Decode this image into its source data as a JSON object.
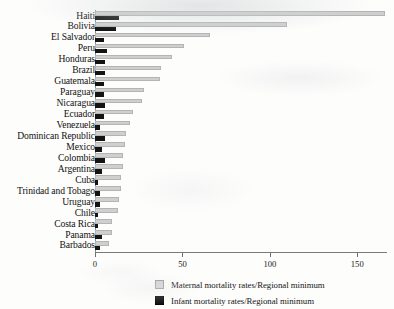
{
  "chart_data": {
    "type": "bar",
    "orientation": "horizontal",
    "title": "",
    "subtitle": "",
    "xlabel": "",
    "ylabel": "",
    "xlim": [
      0,
      170
    ],
    "xticks": [
      0,
      50,
      100,
      150
    ],
    "xticklabels": [
      "0",
      "50",
      "100",
      "150"
    ],
    "grid": false,
    "legend_position": "bottom",
    "categories": [
      "Haiti",
      "Bolivia",
      "El Salvador",
      "Peru",
      "Honduras",
      "Brazil",
      "Guatemala",
      "Paraguay",
      "Nicaragua",
      "Ecuador",
      "Venezuela",
      "Dominican Republic",
      "Mexico",
      "Colombia",
      "Argentina",
      "Cuba",
      "Trinidad and Tobago",
      "Uruguay",
      "Chile",
      "Costa Rica",
      "Panama",
      "Barbados"
    ],
    "series": [
      {
        "name": "Maternal mortality rates/Regional minimum",
        "color": "#cfcfcf",
        "values": [
          166,
          110,
          66,
          51,
          44,
          38,
          37,
          28,
          27,
          22,
          20,
          18,
          17,
          16,
          16,
          15,
          15,
          14,
          13,
          10,
          10,
          8
        ]
      },
      {
        "name": "Infant mortality rates/Regional minimum",
        "color": "#141414",
        "values": [
          14,
          12,
          5,
          7,
          6,
          6,
          5,
          5,
          6,
          5,
          3,
          6,
          4,
          6,
          4,
          2,
          3,
          3,
          2,
          2,
          4,
          3
        ]
      }
    ]
  },
  "legend": {
    "items": [
      {
        "label": "Maternal mortality rates/Regional minimum",
        "swatch": "maternal"
      },
      {
        "label": "Infant mortality rates/Regional minimum",
        "swatch": "infant"
      }
    ]
  }
}
